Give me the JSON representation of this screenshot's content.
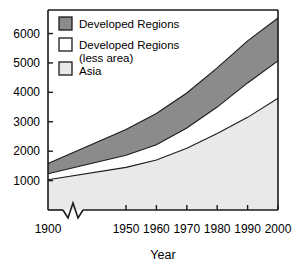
{
  "chart_data": {
    "type": "area",
    "title": "",
    "subtitle": "",
    "xlabel": "Year",
    "ylabel": "",
    "stacked": true,
    "grid": false,
    "legend_position": "top-left inside plot",
    "xlim": [
      1900,
      2000
    ],
    "ylim": [
      0,
      6800
    ],
    "x_axis_break": true,
    "x_axis_break_between": [
      1900,
      1950
    ],
    "x_ticks": [
      1900,
      1950,
      1960,
      1970,
      1980,
      1990,
      2000
    ],
    "x_tick_labels": [
      "1900",
      "1950",
      "1960",
      "1970",
      "1980",
      "1990",
      "2000"
    ],
    "y_ticks": [
      1000,
      2000,
      3000,
      4000,
      5000,
      6000
    ],
    "y_tick_labels": [
      "1000",
      "2000",
      "3000",
      "4000",
      "5000",
      "6000"
    ],
    "x": [
      1900,
      1950,
      1960,
      1970,
      1980,
      1990,
      2000
    ],
    "series": [
      {
        "name": "Asia",
        "color": "#e9e9e9",
        "values": [
          1030,
          1450,
          1700,
          2100,
          2600,
          3150,
          3800
        ]
      },
      {
        "name": "Developed Regions (less area)",
        "color": "#ffffff",
        "values": [
          200,
          410,
          520,
          690,
          900,
          1170,
          1270
        ]
      },
      {
        "name": "Developed Regions",
        "color": "#8b8b8b",
        "values": [
          350,
          880,
          1060,
          1190,
          1330,
          1430,
          1460
        ]
      }
    ],
    "cumulative_tops": {
      "asia": [
        1030,
        1450,
        1700,
        2100,
        2600,
        3150,
        3800
      ],
      "less_area": [
        1230,
        1860,
        2220,
        2790,
        3500,
        4320,
        5070
      ],
      "developed": [
        1580,
        2740,
        3280,
        3980,
        4830,
        5750,
        6530
      ]
    }
  },
  "legend": {
    "items": [
      {
        "label": "Developed Regions",
        "swatch": "#8b8b8b"
      },
      {
        "label": "Developed Regions",
        "label2": "(less area)",
        "swatch": "#ffffff"
      },
      {
        "label": "Asia",
        "swatch": "#e9e9e9"
      }
    ]
  },
  "axis": {
    "x_title": "Year",
    "y_labels": [
      "6000",
      "5000",
      "4000",
      "3000",
      "2000",
      "1000"
    ],
    "x_labels": [
      "1900",
      "1950",
      "1960",
      "1970",
      "1980",
      "1990",
      "2000"
    ]
  },
  "colors": {
    "developed": "#8b8b8b",
    "less_area": "#ffffff",
    "asia": "#e9e9e9",
    "axis": "#1a1a1a",
    "text": "#000000",
    "background": "#ffffff"
  }
}
